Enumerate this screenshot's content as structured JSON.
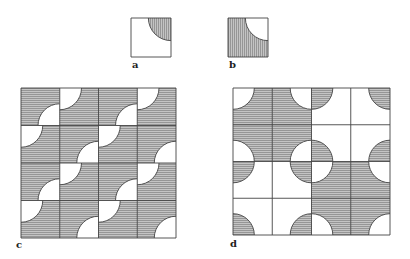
{
  "figure": {
    "colors": {
      "background": "#ffffff",
      "line": "#444444",
      "shade": "#b9b9b9",
      "hatch": "#7a7a7a",
      "label": "#222222"
    },
    "panels": [
      {
        "id": "a",
        "label": "a",
        "label_pos": [
          132,
          60
        ],
        "box": [
          131,
          18,
          40,
          39
        ],
        "rows": 1,
        "cols": 1,
        "hatch": "vertical",
        "tiles": [
          {
            "r": 0,
            "c": 0,
            "type": "a",
            "corner": "TR"
          }
        ]
      },
      {
        "id": "b",
        "label": "b",
        "label_pos": [
          229,
          60
        ],
        "box": [
          228,
          18,
          40,
          39
        ],
        "rows": 1,
        "cols": 1,
        "hatch": "vertical",
        "tiles": [
          {
            "r": 0,
            "c": 0,
            "type": "b",
            "corner": "TR"
          }
        ]
      },
      {
        "id": "c",
        "label": "c",
        "label_pos": [
          16,
          240
        ],
        "box": [
          21,
          88,
          155,
          150
        ],
        "rows": 4,
        "cols": 4,
        "hatch": "horizontal",
        "tiles": [
          {
            "r": 0,
            "c": 0,
            "type": "b",
            "corner": "BR"
          },
          {
            "r": 0,
            "c": 1,
            "type": "b",
            "corner": "TL"
          },
          {
            "r": 0,
            "c": 2,
            "type": "b",
            "corner": "BR"
          },
          {
            "r": 0,
            "c": 3,
            "type": "b",
            "corner": "TL"
          },
          {
            "r": 1,
            "c": 0,
            "type": "b",
            "corner": "TL"
          },
          {
            "r": 1,
            "c": 1,
            "type": "b",
            "corner": "BR"
          },
          {
            "r": 1,
            "c": 2,
            "type": "b",
            "corner": "TL"
          },
          {
            "r": 1,
            "c": 3,
            "type": "b",
            "corner": "BR"
          },
          {
            "r": 2,
            "c": 0,
            "type": "b",
            "corner": "BR"
          },
          {
            "r": 2,
            "c": 1,
            "type": "b",
            "corner": "TL"
          },
          {
            "r": 2,
            "c": 2,
            "type": "b",
            "corner": "BR"
          },
          {
            "r": 2,
            "c": 3,
            "type": "b",
            "corner": "TL"
          },
          {
            "r": 3,
            "c": 0,
            "type": "b",
            "corner": "TL"
          },
          {
            "r": 3,
            "c": 1,
            "type": "b",
            "corner": "BR"
          },
          {
            "r": 3,
            "c": 2,
            "type": "b",
            "corner": "TL"
          },
          {
            "r": 3,
            "c": 3,
            "type": "b",
            "corner": "BR"
          }
        ]
      },
      {
        "id": "d",
        "label": "d",
        "label_pos": [
          230,
          239
        ],
        "box": [
          233,
          88,
          157,
          147
        ],
        "rows": 4,
        "cols": 4,
        "hatch": "horizontal",
        "tiles": [
          {
            "r": 0,
            "c": 0,
            "type": "b",
            "corner": "TL"
          },
          {
            "r": 0,
            "c": 1,
            "type": "b",
            "corner": "TR"
          },
          {
            "r": 0,
            "c": 2,
            "type": "a",
            "corner": "TL"
          },
          {
            "r": 0,
            "c": 3,
            "type": "a",
            "corner": "TR"
          },
          {
            "r": 1,
            "c": 0,
            "type": "b",
            "corner": "BL"
          },
          {
            "r": 1,
            "c": 1,
            "type": "b",
            "corner": "BR"
          },
          {
            "r": 1,
            "c": 2,
            "type": "a",
            "corner": "BL"
          },
          {
            "r": 1,
            "c": 3,
            "type": "a",
            "corner": "BR"
          },
          {
            "r": 2,
            "c": 0,
            "type": "a",
            "corner": "TL"
          },
          {
            "r": 2,
            "c": 1,
            "type": "a",
            "corner": "TR"
          },
          {
            "r": 2,
            "c": 2,
            "type": "b",
            "corner": "TL"
          },
          {
            "r": 2,
            "c": 3,
            "type": "b",
            "corner": "TR"
          },
          {
            "r": 3,
            "c": 0,
            "type": "a",
            "corner": "BL"
          },
          {
            "r": 3,
            "c": 1,
            "type": "a",
            "corner": "BR"
          },
          {
            "r": 3,
            "c": 2,
            "type": "b",
            "corner": "BL"
          },
          {
            "r": 3,
            "c": 3,
            "type": "b",
            "corner": "BR"
          }
        ]
      }
    ]
  }
}
